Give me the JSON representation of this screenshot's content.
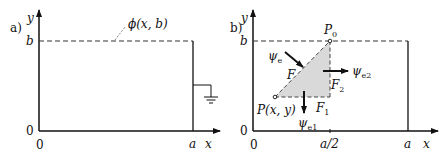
{
  "panel_a": {
    "label": "a)",
    "y_axis_label": "y",
    "x_axis_label": "x",
    "tick_b": "b",
    "tick_origin_y": "0",
    "tick_origin_x": "0",
    "tick_a": "a",
    "boundary_label": "ϕ(x, b)",
    "ground_symbol": "ground"
  },
  "panel_b": {
    "label": "b)",
    "y_axis_label": "y",
    "x_axis_label": "x",
    "tick_b": "b",
    "tick_origin_y": "0",
    "tick_origin_x": "0",
    "tick_half_a": "a/2",
    "tick_a": "a",
    "point_top": "P",
    "point_top_sub": "0",
    "point_bottom": "P(x, y)",
    "hyp_label": "F",
    "vert_label": "F",
    "vert_label_sub": "2",
    "horiz_label": "F",
    "horiz_label_sub": "1",
    "psi_e": "ψ",
    "psi_e_sub": "e",
    "psi_e1": "ψ",
    "psi_e1_sub": "e1",
    "psi_e2": "ψ",
    "psi_e2_sub": "e2",
    "triangle_fill": "#d9d9d9"
  }
}
